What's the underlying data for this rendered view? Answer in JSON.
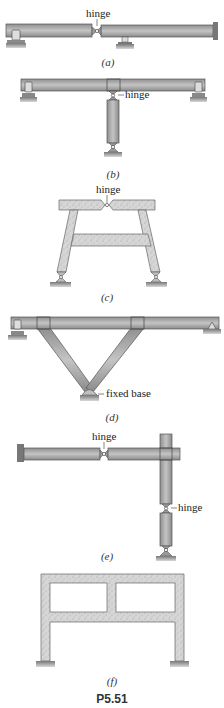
{
  "figure": {
    "id_label": "P5.51",
    "colors": {
      "steel": "#a9a9a9",
      "steel_edge": "#555555",
      "concrete": "#d4d4d4",
      "concrete_edge": "#6a6a6a",
      "ground": "#9a9a9a",
      "text": "#222222"
    },
    "panels": [
      {
        "key": "a",
        "caption": "(a)",
        "annotations": [
          "hinge"
        ],
        "material": "steel",
        "description": "Beam with fixed right end, pin support at left, roller at mid, hinge between left support and mid support"
      },
      {
        "key": "b",
        "caption": "(b)",
        "annotations": [
          "hinge"
        ],
        "material": "steel",
        "description": "Horizontal beam on two end supports, with a vertical column hinged under the beam center and pinned at base"
      },
      {
        "key": "c",
        "caption": "(c)",
        "annotations": [
          "hinge"
        ],
        "material": "concrete",
        "description": "Trapezoidal concrete frame with hinge at top center, crossbeam, pinned at both bases"
      },
      {
        "key": "d",
        "caption": "(d)",
        "annotations": [
          "fixed base"
        ],
        "material": "steel",
        "description": "Beam on end supports braced by V-shaped struts meeting at a fixed base"
      },
      {
        "key": "e",
        "caption": "(e)",
        "annotations": [
          "hinge",
          "hinge"
        ],
        "material": "steel",
        "description": "Cantilever from fixed wall with hinge, connected to vertical column with hinge, pinned at base"
      },
      {
        "key": "f",
        "caption": "(f)",
        "annotations": [],
        "material": "concrete",
        "description": "Two-bay two-level concrete frame fixed at both bases"
      }
    ]
  }
}
